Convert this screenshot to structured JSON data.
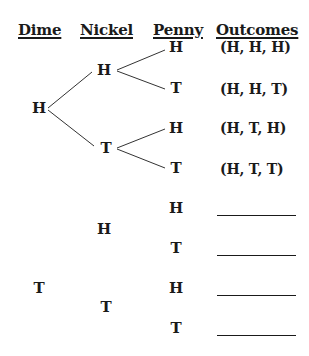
{
  "headers": {
    "dime": "Dime",
    "nickel": "Nickel",
    "penny": "Penny",
    "outcomes": "Outcomes"
  },
  "tree": {
    "dime": [
      {
        "label": "H",
        "x": 39,
        "y": 108
      },
      {
        "label": "T",
        "x": 39,
        "y": 288
      }
    ],
    "nickel": [
      {
        "label": "H",
        "x": 104,
        "y": 70
      },
      {
        "label": "T",
        "x": 106,
        "y": 148
      },
      {
        "label": "H",
        "x": 104,
        "y": 229
      },
      {
        "label": "T",
        "x": 106,
        "y": 307
      }
    ],
    "penny": [
      {
        "label": "H",
        "x": 176,
        "y": 47
      },
      {
        "label": "T",
        "x": 176,
        "y": 88
      },
      {
        "label": "H",
        "x": 176,
        "y": 128
      },
      {
        "label": "T",
        "x": 176,
        "y": 168
      },
      {
        "label": "H",
        "x": 176,
        "y": 208
      },
      {
        "label": "T",
        "x": 176,
        "y": 248
      },
      {
        "label": "H",
        "x": 176,
        "y": 288
      },
      {
        "label": "T",
        "x": 176,
        "y": 328
      }
    ]
  },
  "outcomes": [
    {
      "text": "(H, H, H)",
      "y": 47
    },
    {
      "text": "(H, H, T)",
      "y": 89
    },
    {
      "text": "(H, T, H)",
      "y": 128
    },
    {
      "text": "(H, T, T)",
      "y": 169
    },
    {
      "text": "",
      "y": 208
    },
    {
      "text": "",
      "y": 248
    },
    {
      "text": "",
      "y": 288
    },
    {
      "text": "",
      "y": 328
    }
  ]
}
